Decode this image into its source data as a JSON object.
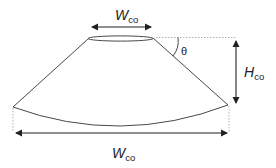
{
  "diagram": {
    "type": "cone-geometry",
    "labels": {
      "top_width": {
        "main": "W",
        "sub": "co"
      },
      "height": {
        "main": "H",
        "sub": "co"
      },
      "bottom_width": {
        "main": "W",
        "sub": "co"
      },
      "angle": "θ"
    },
    "colors": {
      "stroke": "#333333",
      "dotted": "#aaaaaa",
      "text": "#222222"
    }
  }
}
